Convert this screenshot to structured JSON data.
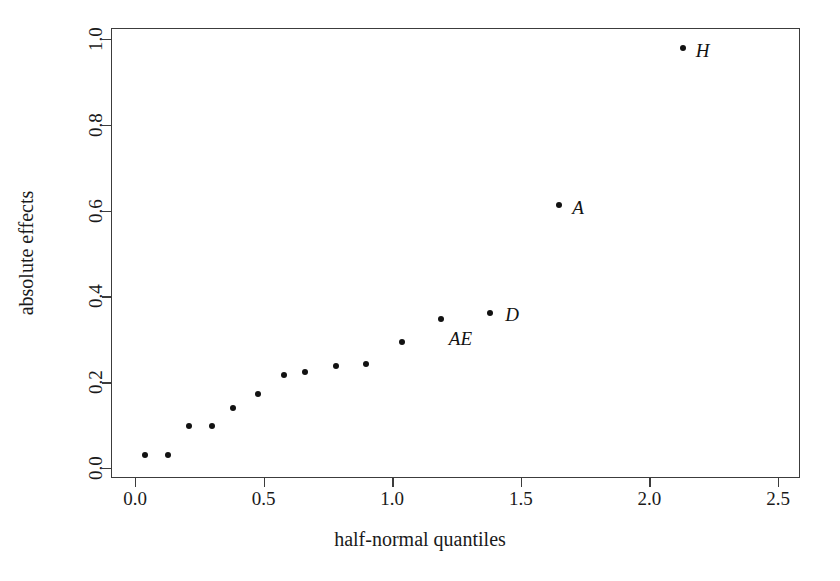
{
  "chart_data": {
    "type": "scatter",
    "title": "",
    "xlabel": "half-normal quantiles",
    "ylabel": "absolute effects",
    "xlim": [
      -0.06,
      2.62
    ],
    "ylim": [
      -0.023,
      1.028
    ],
    "xticks": [
      "0.0",
      "0.5",
      "1.0",
      "1.5",
      "2.0",
      "2.5"
    ],
    "xtick_values": [
      0.0,
      0.5,
      1.0,
      1.5,
      2.0,
      2.5
    ],
    "yticks": [
      "0.0",
      "0.2",
      "0.4",
      "0.6",
      "0.8",
      "1.0"
    ],
    "ytick_values": [
      0.0,
      0.2,
      0.4,
      0.6,
      0.8,
      1.0
    ],
    "grid": false,
    "legend": null,
    "marker": "filled-circle",
    "marker_color": "#121212",
    "axis_color": "#3c3c3c",
    "background": "#ffffff",
    "points": [
      {
        "x": 0.04,
        "y": 0.03,
        "label": ""
      },
      {
        "x": 0.13,
        "y": 0.03,
        "label": ""
      },
      {
        "x": 0.21,
        "y": 0.099,
        "label": ""
      },
      {
        "x": 0.3,
        "y": 0.099,
        "label": ""
      },
      {
        "x": 0.38,
        "y": 0.139,
        "label": ""
      },
      {
        "x": 0.48,
        "y": 0.173,
        "label": ""
      },
      {
        "x": 0.58,
        "y": 0.217,
        "label": ""
      },
      {
        "x": 0.66,
        "y": 0.224,
        "label": ""
      },
      {
        "x": 0.78,
        "y": 0.238,
        "label": ""
      },
      {
        "x": 0.9,
        "y": 0.243,
        "label": ""
      },
      {
        "x": 1.04,
        "y": 0.294,
        "label": ""
      },
      {
        "x": 1.19,
        "y": 0.347,
        "label": "AE"
      },
      {
        "x": 1.38,
        "y": 0.361,
        "label": "D"
      },
      {
        "x": 1.65,
        "y": 0.613,
        "label": "A"
      },
      {
        "x": 2.13,
        "y": 0.979,
        "label": "H"
      }
    ],
    "annotations": [
      {
        "text": "AE",
        "x": 1.22,
        "y": 0.3,
        "style": "italic"
      },
      {
        "text": "D",
        "x": 1.44,
        "y": 0.357,
        "style": "italic"
      },
      {
        "text": "A",
        "x": 1.7,
        "y": 0.605,
        "style": "italic"
      },
      {
        "text": "H",
        "x": 2.18,
        "y": 0.972,
        "style": "italic"
      }
    ]
  }
}
